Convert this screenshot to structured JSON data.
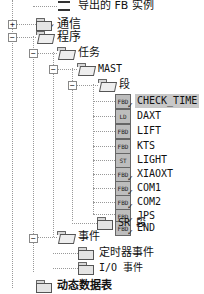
{
  "tree": {
    "nodes": [
      {
        "id": "fb-instances",
        "label": "导出的 FB 实例",
        "icon": "instance-icon",
        "level": 1
      },
      {
        "id": "comm",
        "label": "通信",
        "icon": "folder-icon",
        "expander": "+",
        "level": 0
      },
      {
        "id": "program",
        "label": "程序",
        "icon": "folder-open-icon",
        "expander": "−",
        "level": 0
      },
      {
        "id": "tasks",
        "label": "任务",
        "icon": "folder-open-icon",
        "expander": "−",
        "level": 1
      },
      {
        "id": "mast",
        "label": "MAST",
        "icon": "folder-open-icon",
        "expander": "−",
        "level": 2
      },
      {
        "id": "sections",
        "label": "段",
        "icon": "folder-open-icon",
        "expander": "−",
        "level": 3
      },
      {
        "id": "check-time",
        "label": "CHECK_TIME",
        "icon": "fbd-icon",
        "badge": "FBD",
        "selected": true,
        "level": 4
      },
      {
        "id": "daxt",
        "label": "DAXT",
        "icon": "ld-icon",
        "badge": "LD",
        "level": 4
      },
      {
        "id": "lift",
        "label": "LIFT",
        "icon": "fbd-icon",
        "badge": "FBD",
        "level": 4
      },
      {
        "id": "kts",
        "label": "KTS",
        "icon": "fbd-icon",
        "badge": "FBD",
        "level": 4
      },
      {
        "id": "light",
        "label": "LIGHT",
        "icon": "st-icon",
        "badge": "ST",
        "level": 4
      },
      {
        "id": "xiaoxt",
        "label": "XIAOXT",
        "icon": "fbd-icon",
        "badge": "FBD",
        "level": 4
      },
      {
        "id": "com1",
        "label": "COM1",
        "icon": "fbd-icon",
        "badge": "FBD",
        "level": 4
      },
      {
        "id": "com2",
        "label": "COM2",
        "icon": "fbd-icon",
        "badge": "FBD",
        "level": 4
      },
      {
        "id": "jps",
        "label": "JPS",
        "icon": "fbd-icon",
        "badge": "FBD",
        "level": 4
      },
      {
        "id": "end",
        "label": "END",
        "icon": "fbd-icon",
        "badge": "FBD",
        "level": 4
      },
      {
        "id": "sr-sections",
        "label": "SR 段",
        "icon": "folder-icon",
        "level": 3
      },
      {
        "id": "events",
        "label": "事件",
        "icon": "folder-open-icon",
        "expander": "−",
        "level": 1
      },
      {
        "id": "timer-events",
        "label": "定时器事件",
        "icon": "folder-icon",
        "level": 2
      },
      {
        "id": "io-events",
        "label": "I/O 事件",
        "icon": "folder-icon",
        "level": 2
      },
      {
        "id": "dynamic-tables",
        "label": "动态数据表",
        "icon": "folder-icon",
        "level": 0
      }
    ]
  }
}
